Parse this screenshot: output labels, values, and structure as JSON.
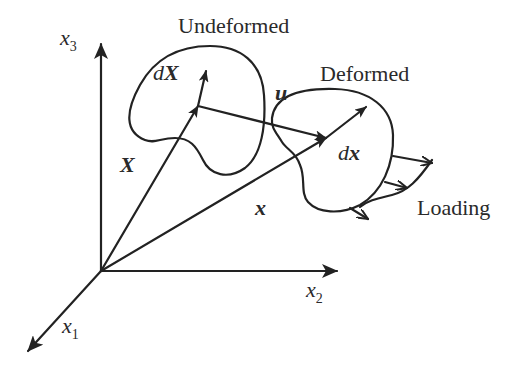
{
  "diagram": {
    "colors": {
      "ink": "#222222",
      "background": "#ffffff"
    },
    "axes": {
      "x1": {
        "base": "x",
        "sub": "1"
      },
      "x2": {
        "base": "x",
        "sub": "2"
      },
      "x3": {
        "base": "x",
        "sub": "3"
      }
    },
    "regions": {
      "undeformed": "Undeformed",
      "deformed": "Deformed",
      "loading": "Loading"
    },
    "vectors": {
      "X": "X",
      "dX_d": "d",
      "dX_X": "X",
      "u": "u",
      "x": "x",
      "dx_d": "d",
      "dx_x": "x"
    }
  }
}
